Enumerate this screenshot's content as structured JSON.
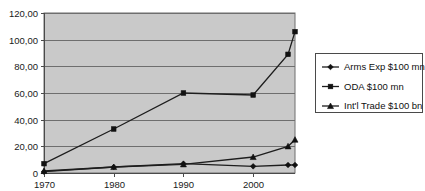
{
  "chart_data": {
    "type": "line",
    "title": "",
    "subtitle": "",
    "xlabel": "",
    "ylabel": "",
    "x": [
      1970,
      1980,
      1990,
      2000,
      2005,
      2006
    ],
    "categories": [
      "1970",
      "1980",
      "1990",
      "2000",
      "2005",
      "2006"
    ],
    "series": [
      {
        "name": "Arms Exp $100 mn",
        "marker": "diamond",
        "values": [
          1.0,
          4.5,
          7.0,
          5.0,
          6.0,
          6.0
        ]
      },
      {
        "name": "ODA $100 mn",
        "marker": "square",
        "values": [
          7.0,
          33.0,
          60.0,
          58.5,
          89.0,
          106.0
        ]
      },
      {
        "name": "Int'l Trade $100 bn",
        "marker": "triangle",
        "values": [
          1.5,
          4.5,
          6.5,
          12.0,
          20.0,
          25.0
        ]
      }
    ],
    "ylim": [
      0,
      120
    ],
    "y_ticks": [
      0,
      20,
      40,
      60,
      80,
      100,
      120
    ],
    "y_tick_labels": [
      "0",
      "20,00",
      "40,00",
      "60,00",
      "80,00",
      "100,00",
      "120,00"
    ],
    "x_ticks": [
      1970,
      1980,
      1990,
      2000
    ],
    "x_tick_labels": [
      "1970",
      "1980",
      "1990",
      "2000"
    ],
    "grid": true,
    "grid_axis": "y",
    "legend_position": "right",
    "plot_background": "#c9c9c9",
    "figure_background": "#ffffff",
    "line_color": "#1d1d1d"
  },
  "legend": {
    "entries": [
      {
        "label": "Arms Exp $100 mn",
        "marker": "diamond"
      },
      {
        "label": "ODA $100 mn",
        "marker": "square"
      },
      {
        "label": "Int'l Trade $100 bn",
        "marker": "triangle"
      }
    ]
  },
  "y_axis": {
    "labels": [
      "120,00",
      "100,00",
      "80,00",
      "60,00",
      "40,00",
      "20,00",
      "0"
    ]
  },
  "x_axis": {
    "labels": [
      "1970",
      "1980",
      "1990",
      "2000"
    ]
  }
}
